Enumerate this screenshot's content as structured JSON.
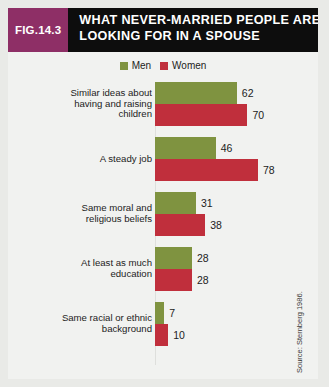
{
  "figure": {
    "badge": "FIG.14.3",
    "title_line1": "WHAT NEVER-MARRIED PEOPLE ARE",
    "title_line2": "LOOKING FOR IN A SPOUSE",
    "source": "Source: Sternberg 1986.",
    "badge_color": "#8e2f66",
    "header_color": "#0d0d0d",
    "background_color": "#f1f2f0"
  },
  "legend": {
    "items": [
      {
        "label": "Men",
        "color": "#7f9340"
      },
      {
        "label": "Women",
        "color": "#c02f3c"
      }
    ]
  },
  "chart_data": {
    "type": "bar",
    "orientation": "horizontal",
    "title": "WHAT NEVER-MARRIED PEOPLE ARE LOOKING FOR IN A SPOUSE",
    "subtitle": "",
    "xlabel": "",
    "ylabel": "",
    "xlim": [
      0,
      80
    ],
    "grid": false,
    "legend_position": "top-center",
    "categories": [
      "Similar ideas about having and raising children",
      "A steady job",
      "Same moral and religious beliefs",
      "At least as much education",
      "Same racial or ethnic background"
    ],
    "category_lines": [
      [
        "Similar ideas about",
        "having and raising",
        "children"
      ],
      [
        "A steady job"
      ],
      [
        "Same moral and",
        "religious beliefs"
      ],
      [
        "At least as much",
        "education"
      ],
      [
        "Same racial or ethnic",
        "background"
      ]
    ],
    "series": [
      {
        "name": "Men",
        "color": "#7f9340",
        "values": [
          62,
          46,
          31,
          28,
          7
        ]
      },
      {
        "name": "Women",
        "color": "#c02f3c",
        "values": [
          70,
          78,
          38,
          28,
          10
        ]
      }
    ],
    "value_labels": {
      "men": [
        "62",
        "46",
        "31",
        "28",
        "7"
      ],
      "women": [
        "70",
        "78",
        "38",
        "28",
        "10"
      ]
    }
  }
}
